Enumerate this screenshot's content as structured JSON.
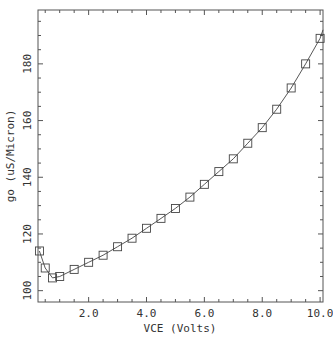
{
  "chart_data": {
    "type": "line",
    "title": "",
    "xlabel": "VCE (Volts)",
    "ylabel": "go (uS/Micron)",
    "xlim": [
      0.25,
      10.1
    ],
    "ylim": [
      96,
      199
    ],
    "xticks": [
      2.0,
      4.0,
      6.0,
      8.0,
      10.0
    ],
    "xtick_labels": [
      "2.0",
      "4.0",
      "6.0",
      "8.0",
      "10.0"
    ],
    "yticks": [
      100,
      120,
      140,
      160,
      180
    ],
    "ytick_labels": [
      "100",
      "120",
      "140",
      "160",
      "180"
    ],
    "grid": false,
    "legend": null,
    "series": [
      {
        "name": "go",
        "marker": "square",
        "line": "solid",
        "x": [
          0.3,
          0.5,
          0.75,
          1.0,
          1.5,
          2.0,
          2.5,
          3.0,
          3.5,
          4.0,
          4.5,
          5.0,
          5.5,
          6.0,
          6.5,
          7.0,
          7.5,
          8.0,
          8.5,
          9.0,
          9.5,
          10.0
        ],
        "y": [
          114,
          108,
          104.5,
          105,
          107.5,
          110,
          112.5,
          115.5,
          118.5,
          122,
          125.5,
          129,
          133,
          137.5,
          142,
          146.5,
          152,
          157.5,
          164,
          171.5,
          180,
          189
        ]
      }
    ]
  },
  "colors": {
    "line": "#444444",
    "marker": "#444444",
    "axis": "#555555",
    "text": "#333333",
    "background": "#ffffff"
  }
}
